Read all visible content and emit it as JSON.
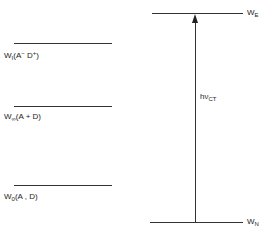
{
  "diagram": {
    "left_levels": [
      {
        "symbol": "W",
        "sub": "I",
        "args": "(A",
        "sup1": "−",
        "mid": " D",
        "sup2": "+",
        "close": ")"
      },
      {
        "symbol": "W",
        "sub": "∞",
        "args": "(A + D)"
      },
      {
        "symbol": "W",
        "sub": "0",
        "args": "(A , D)"
      }
    ],
    "right_levels": {
      "top": {
        "symbol": "W",
        "sub": "E"
      },
      "bottom": {
        "symbol": "W",
        "sub": "N"
      }
    },
    "transition": {
      "label": "hν",
      "sub": "CT"
    }
  }
}
